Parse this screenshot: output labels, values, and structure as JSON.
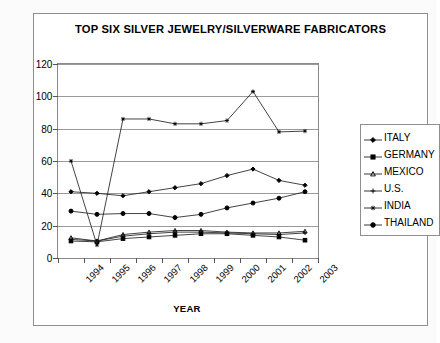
{
  "chart_data": {
    "type": "line",
    "title": "TOP SIX SILVER JEWELRY/SILVERWARE FABRICATORS",
    "xlabel": "YEAR",
    "ylabel": "MILLION OUNCES",
    "grid": true,
    "legend_position": "right",
    "ylim": [
      0,
      120
    ],
    "yticks": [
      0,
      20,
      40,
      60,
      80,
      100,
      120
    ],
    "categories": [
      "1994",
      "1995",
      "1996",
      "1997",
      "1998",
      "1999",
      "2000",
      "2001",
      "2002",
      "2003"
    ],
    "series": [
      {
        "name": "ITALY",
        "marker": "diamond",
        "values": [
          41,
          40,
          38.5,
          41,
          43.5,
          46,
          51,
          55,
          48,
          45
        ]
      },
      {
        "name": "GERMANY",
        "marker": "square",
        "values": [
          10.5,
          10,
          12,
          13,
          14,
          15,
          15,
          14,
          13,
          11
        ]
      },
      {
        "name": "MEXICO",
        "marker": "triangle",
        "values": [
          12.5,
          10.5,
          14.5,
          16,
          17,
          17,
          16,
          15.5,
          15.5,
          16.5
        ]
      },
      {
        "name": "U.S.",
        "marker": "cross",
        "values": [
          11.5,
          10.5,
          13.5,
          15,
          16,
          16,
          15.5,
          15,
          14.5,
          15.5
        ]
      },
      {
        "name": "INDIA",
        "marker": "star",
        "values": [
          60,
          8,
          86,
          86,
          83,
          83,
          85,
          103,
          78,
          78.5
        ]
      },
      {
        "name": "THAILAND",
        "marker": "circle",
        "values": [
          29,
          27,
          27.5,
          27.5,
          25,
          27,
          31,
          34,
          37,
          41
        ]
      }
    ]
  },
  "legend": {
    "items": [
      {
        "label": "ITALY"
      },
      {
        "label": "GERMANY"
      },
      {
        "label": "MEXICO"
      },
      {
        "label": "U.S."
      },
      {
        "label": "INDIA"
      },
      {
        "label": "THAILAND"
      }
    ]
  }
}
